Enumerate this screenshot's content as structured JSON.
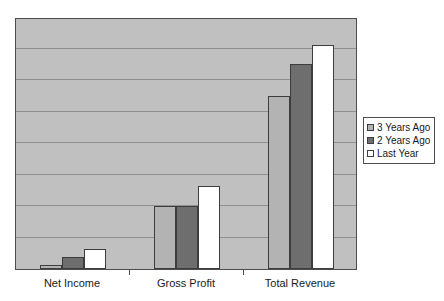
{
  "chart_data": {
    "type": "bar",
    "title": "",
    "subtitle": "",
    "xlabel": "",
    "ylabel": "",
    "categories": [
      "Net Income",
      "Gross Profit",
      "Total Revenue"
    ],
    "series": [
      {
        "name": "3 Years Ago",
        "color": "#b3b3b3",
        "values": [
          1,
          16,
          44
        ]
      },
      {
        "name": "2 Years Ago",
        "color": "#6e6e6e",
        "values": [
          3,
          16,
          52
        ]
      },
      {
        "name": "Last Year",
        "color": "#ffffff",
        "values": [
          5,
          21,
          57
        ]
      }
    ],
    "ylim": [
      0,
      64
    ],
    "y_tick_interval": 8,
    "y_tick_labels": [],
    "grid": true,
    "grid_axis": "y",
    "legend_position": "right",
    "plot_background": "#c0c0c0",
    "figure_background": "#ffffff",
    "axis_color": "#4d4d4d",
    "gridline_color": "#8f8f8f"
  },
  "legend": {
    "entries": [
      {
        "label": "3 Years Ago",
        "swatch": "legend-swatch-3-years-ago"
      },
      {
        "label": "2 Years Ago",
        "swatch": "legend-swatch-2-years-ago"
      },
      {
        "label": "Last Year",
        "swatch": "legend-swatch-last-year"
      }
    ]
  },
  "axis": {
    "category_labels": [
      "Net Income",
      "Gross Profit",
      "Total Revenue"
    ]
  }
}
